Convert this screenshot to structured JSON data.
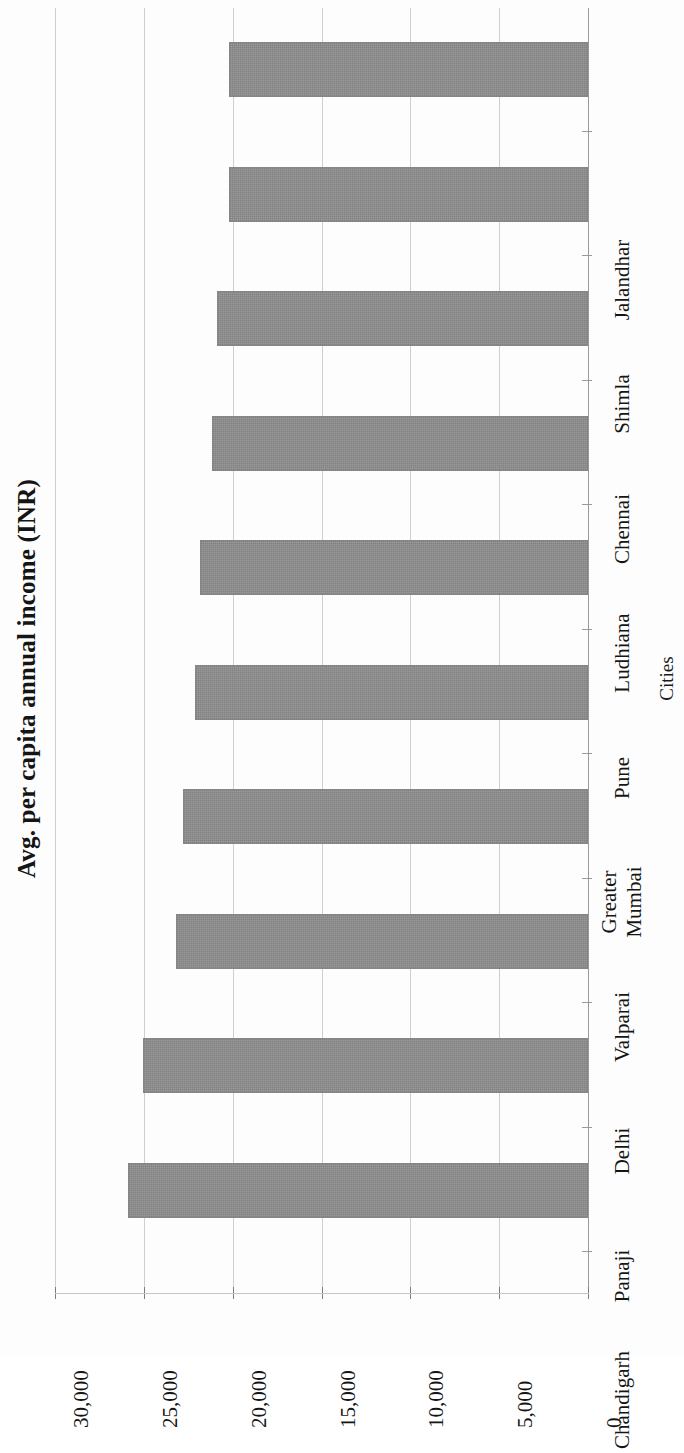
{
  "chart_data": {
    "type": "bar",
    "orientation": "horizontal",
    "title": "Avg. per capita annual income (INR)",
    "xlabel": "Cities",
    "ylabel": "",
    "categories": [
      "Chandigarh",
      "Panaji",
      "Delhi",
      "Valparai",
      "Greater\nMumbai",
      "Pune",
      "Ludhiana",
      "Chennai",
      "Shimla",
      "Jalandhar"
    ],
    "values": [
      25900,
      25050,
      23200,
      22800,
      22100,
      21850,
      21150,
      20900,
      20200,
      20200
    ],
    "value_axis_ticks": [
      "0",
      "5,000",
      "10,000",
      "15,000",
      "20,000",
      "25,000",
      "30,000"
    ],
    "value_axis_tick_values": [
      0,
      5000,
      10000,
      15000,
      20000,
      25000,
      30000
    ],
    "ylim": [
      0,
      30000
    ],
    "grid": true,
    "legend": null,
    "bar_color": "#8c8c8c",
    "gridline_color": "#cfcfcf",
    "axis_color": "#9a9a9a",
    "text_color": "#151515"
  }
}
